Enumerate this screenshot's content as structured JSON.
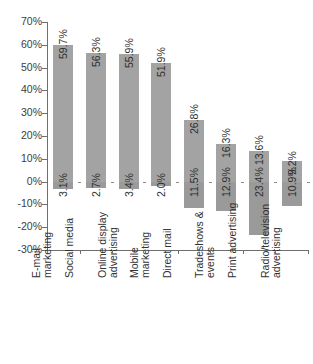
{
  "chart_data": {
    "type": "bar",
    "title": "",
    "subtitle": "",
    "xlabel": "",
    "ylabel": "",
    "ylim": [
      -30,
      70
    ],
    "ytick_step": 10,
    "grid": false,
    "legend": "none",
    "orientation": "vertical",
    "value_label_rotation": -90,
    "category_label_rotation": -90,
    "yticks": [
      "70%",
      "60%",
      "50%",
      "40%",
      "30%",
      "20%",
      "10%",
      "0%",
      "-10%",
      "-20%",
      "-30%"
    ],
    "ytick_values": [
      70,
      60,
      50,
      40,
      30,
      20,
      10,
      0,
      -10,
      -20,
      -30
    ],
    "categories": [
      "E-mail marketing",
      "Social media",
      "Online display advertising",
      "Mobile marketing",
      "Direct mail",
      "Tradeshows & events",
      "Print advertising",
      "Radio/television advertising"
    ],
    "category_lines": [
      [
        "E-mail",
        "marketing"
      ],
      [
        "Social media",
        ""
      ],
      [
        "Online display",
        "advertising"
      ],
      [
        "Mobile",
        "marketing"
      ],
      [
        "Direct mail",
        ""
      ],
      [
        "Tradeshows &",
        "events"
      ],
      [
        "Print advertising",
        ""
      ],
      [
        "Radio/television",
        "advertising"
      ]
    ],
    "series": [
      {
        "name": "Increase",
        "color": "#a3a3a3",
        "values": [
          59.7,
          56.3,
          55.9,
          51.9,
          26.8,
          16.3,
          13.6,
          9.2
        ],
        "labels": [
          "59.7%",
          "56.3%",
          "55.9%",
          "51.9%",
          "26.8%",
          "16.3%",
          "13.6%",
          "9.2%"
        ]
      },
      {
        "name": "Decrease",
        "color": "#9a9a9a",
        "values": [
          -3.1,
          -2.7,
          -3.4,
          -2.0,
          -11.5,
          -12.9,
          -23.4,
          -10.9
        ],
        "labels": [
          "3.1%",
          "2.7%",
          "3.4%",
          "2.0%",
          "11.5%",
          "12.9%",
          "23.4%",
          "10.9%"
        ]
      }
    ]
  },
  "colors": {
    "bar_positive": "#a3a3a3",
    "bar_negative": "#9a9a9a",
    "axis": "#6f6f6f",
    "text": "#333333",
    "background": "#ffffff"
  }
}
